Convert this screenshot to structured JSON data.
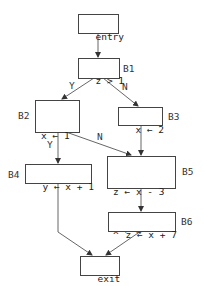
{
  "diagram": {
    "type": "control-flow-graph",
    "nodes": {
      "entry": {
        "lines": [
          "entry"
        ]
      },
      "B1": {
        "label": "B1",
        "lines": [
          "z > 1"
        ]
      },
      "B2": {
        "label": "B2",
        "lines": [
          "x ← 1",
          "z > 2"
        ]
      },
      "B3": {
        "label": "B3",
        "lines": [
          "x ← 2"
        ]
      },
      "B4": {
        "label": "B4",
        "lines": [
          "y ← x + 1"
        ]
      },
      "B5": {
        "label": "B5",
        "lines": [
          "z ← x - 3",
          "x ← 4"
        ]
      },
      "B6": {
        "label": "B6",
        "lines": [
          "z ← x + 7"
        ]
      },
      "exit": {
        "lines": [
          "exit"
        ]
      }
    },
    "edges": [
      {
        "from": "entry",
        "to": "B1",
        "label": ""
      },
      {
        "from": "B1",
        "to": "B2",
        "label": "Y"
      },
      {
        "from": "B1",
        "to": "B3",
        "label": "N"
      },
      {
        "from": "B2",
        "to": "B4",
        "label": "Y"
      },
      {
        "from": "B2",
        "to": "B5",
        "label": "N"
      },
      {
        "from": "B3",
        "to": "B5",
        "label": ""
      },
      {
        "from": "B5",
        "to": "B6",
        "label": ""
      },
      {
        "from": "B4",
        "to": "exit",
        "label": ""
      },
      {
        "from": "B6",
        "to": "exit",
        "label": ""
      }
    ],
    "edge_labels": {
      "b1_yes": "Y",
      "b1_no": "N",
      "b2_yes": "Y",
      "b2_no": "N"
    }
  }
}
